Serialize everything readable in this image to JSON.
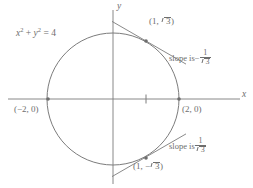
{
  "figure": {
    "kind": "circle-with-tangents",
    "colors": {
      "stroke": "#6e6e6e",
      "text": "#6e6e6e",
      "background": "#ffffff"
    },
    "geometry": {
      "center_px": [
        113,
        99
      ],
      "radius_px": 66,
      "unit_px": 33,
      "x_axis_y_px": 99,
      "y_axis_x_px": 113
    }
  },
  "axes": {
    "x_label": "x",
    "y_label": "y",
    "tick_unit_label": ""
  },
  "equation": {
    "lhs_var1": "x",
    "lhs_exp1": "2",
    "plus": "+",
    "lhs_var2": "y",
    "lhs_exp2": "2",
    "equals": "=",
    "rhs": "4",
    "full_text": "x^2 + y^2 = 4"
  },
  "points": [
    {
      "name": "left-intercept",
      "label_open": "(",
      "label_text": "−2, 0",
      "label_close": ")",
      "full_text": "(−2, 0)",
      "coords": [
        -2,
        0
      ],
      "px": [
        48,
        99
      ]
    },
    {
      "name": "right-intercept",
      "label_open": "(",
      "label_text": "2, 0",
      "label_close": ")",
      "full_text": "(2, 0)",
      "coords": [
        2,
        0
      ],
      "px": [
        179,
        99
      ]
    },
    {
      "name": "upper-tangent-point",
      "prefix": "(1, ",
      "radicand": "3",
      "suffix": ")",
      "full_text": "(1, √3)",
      "coords": [
        1,
        1.7320508
      ],
      "px": [
        146,
        41
      ]
    },
    {
      "name": "lower-tangent-point",
      "prefix": "(1, −",
      "radicand": "3",
      "suffix": ")",
      "full_text": "(1, −√3)",
      "coords": [
        1,
        -1.7320508
      ],
      "px": [
        146,
        158
      ]
    }
  ],
  "annotations": [
    {
      "name": "upper-slope",
      "text": "slope is",
      "sign": "−",
      "numerator": "1",
      "denominator_radicand": "3",
      "full_text": "slope is −1/√3",
      "value": -0.5773503
    },
    {
      "name": "lower-slope",
      "text": "slope is",
      "sign": "",
      "numerator": "1",
      "denominator_radicand": "3",
      "full_text": "slope is 1/√3",
      "value": 0.5773503
    }
  ]
}
